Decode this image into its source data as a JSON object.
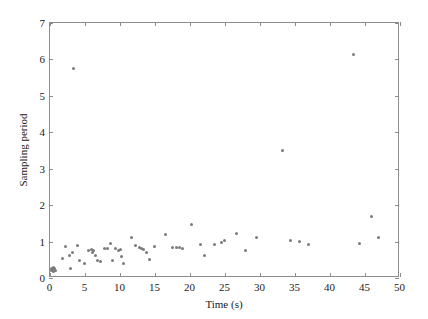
{
  "figure": {
    "background_color": "#ffffff",
    "axis_color": "#8c8c8c",
    "marker_color": "#7a7a7a",
    "text_color": "#1a1a1a"
  },
  "chart_data": {
    "type": "scatter",
    "title": "",
    "xlabel": "Time (s)",
    "ylabel": "Sampling period",
    "xlim": [
      0,
      50
    ],
    "ylim": [
      0,
      7
    ],
    "xticks": [
      0,
      5,
      10,
      15,
      20,
      25,
      30,
      35,
      40,
      45,
      50
    ],
    "yticks": [
      0,
      1,
      2,
      3,
      4,
      5,
      6,
      7
    ],
    "xticklabels": [
      "0",
      "5",
      "10",
      "15",
      "20",
      "25",
      "30",
      "35",
      "40",
      "45",
      "50"
    ],
    "yticklabels": [
      "0",
      "1",
      "2",
      "3",
      "4",
      "5",
      "6",
      "7"
    ],
    "grid": false,
    "legend": null,
    "marker": "dot",
    "series": [
      {
        "name": "sampling period",
        "points": [
          [
            0.3,
            0.18
          ],
          [
            0.4,
            0.22
          ],
          [
            0.5,
            0.2
          ],
          [
            0.6,
            0.26
          ],
          [
            0.7,
            0.15
          ],
          [
            0.8,
            0.24
          ],
          [
            0.9,
            0.19
          ],
          [
            1.9,
            0.52
          ],
          [
            2.4,
            0.83
          ],
          [
            2.9,
            0.6
          ],
          [
            3.1,
            0.24
          ],
          [
            3.3,
            0.67
          ],
          [
            3.5,
            5.72
          ],
          [
            4.0,
            0.86
          ],
          [
            4.3,
            0.45
          ],
          [
            5.1,
            0.36
          ],
          [
            5.6,
            0.72
          ],
          [
            6.0,
            0.76
          ],
          [
            6.2,
            0.66
          ],
          [
            6.4,
            0.72
          ],
          [
            6.6,
            0.6
          ],
          [
            6.9,
            0.44
          ],
          [
            7.4,
            0.43
          ],
          [
            7.9,
            0.77
          ],
          [
            8.4,
            0.79
          ],
          [
            8.8,
            0.92
          ],
          [
            9.1,
            0.44
          ],
          [
            9.5,
            0.77
          ],
          [
            9.9,
            0.73
          ],
          [
            10.2,
            0.76
          ],
          [
            10.4,
            0.56
          ],
          [
            10.6,
            0.38
          ],
          [
            11.8,
            1.09
          ],
          [
            12.4,
            0.86
          ],
          [
            12.9,
            0.81
          ],
          [
            13.2,
            0.78
          ],
          [
            13.5,
            0.75
          ],
          [
            13.9,
            0.68
          ],
          [
            14.4,
            0.49
          ],
          [
            15.1,
            0.85
          ],
          [
            16.7,
            1.16
          ],
          [
            17.7,
            0.8
          ],
          [
            18.2,
            0.82
          ],
          [
            18.6,
            0.8
          ],
          [
            19.0,
            0.79
          ],
          [
            20.4,
            1.45
          ],
          [
            21.6,
            0.9
          ],
          [
            22.2,
            0.6
          ],
          [
            23.7,
            0.88
          ],
          [
            24.6,
            0.96
          ],
          [
            25.1,
            1.0
          ],
          [
            26.8,
            1.2
          ],
          [
            28.0,
            0.72
          ],
          [
            29.7,
            1.09
          ],
          [
            33.4,
            3.48
          ],
          [
            34.5,
            0.99
          ],
          [
            35.8,
            0.98
          ],
          [
            37.0,
            0.88
          ],
          [
            43.5,
            6.1
          ],
          [
            44.3,
            0.92
          ],
          [
            46.0,
            1.65
          ],
          [
            47.0,
            1.08
          ]
        ]
      }
    ]
  }
}
